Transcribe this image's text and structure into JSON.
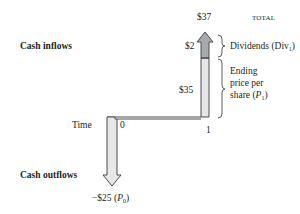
{
  "diagram": {
    "labels": {
      "cash_inflows": "Cash inflows",
      "cash_outflows": "Cash outflows",
      "time": "Time",
      "t0": "0",
      "t1": "1",
      "total_value": "$37",
      "total_label": "TOTAL",
      "dividend_value": "$2",
      "dividend_label_main": "Dividends (Div",
      "dividend_label_sub": "1",
      "dividend_label_close": ")",
      "price_value": "$35",
      "price_label_line1": "Ending",
      "price_label_line2": "price per",
      "price_label_line3_main": "share (",
      "price_label_line3_var": "P",
      "price_label_line3_sub": "1",
      "price_label_line3_close": ")",
      "outflow_value": "−$25 (",
      "outflow_var": "P",
      "outflow_sub": "0",
      "outflow_close": ")"
    },
    "colors": {
      "arrow_outline": "#4d4d4f",
      "arrow_fill_light": "#e6e7e8",
      "arrow_fill_dark": "#a7a9ac",
      "line": "#4d4d4f",
      "text": "#231f20"
    }
  }
}
